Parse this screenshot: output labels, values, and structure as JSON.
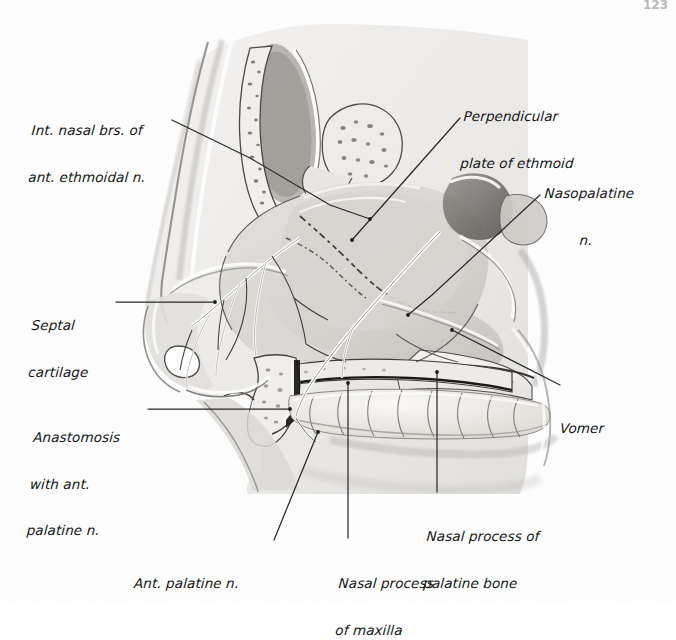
{
  "figure": {
    "page_number": "123",
    "style": "pencil-and-wash anatomical illustration, lateral view of nasal septum"
  },
  "labels": [
    {
      "id": "int-nasal-brs",
      "name": "int-nasal-branches-anterior-ethmoidal-nerve",
      "lines": [
        "Int. nasal brs. of",
        "ant. ethmoidal n."
      ],
      "text": "Int. nasal brs. of ant. ethmoidal n.",
      "x": 30,
      "y": 92,
      "align": "left",
      "leader": [
        [
          172,
          120
        ],
        [
          250,
          158
        ],
        [
          330,
          205
        ],
        [
          370,
          219
        ]
      ]
    },
    {
      "id": "perpendicular-plate",
      "name": "perpendicular-plate-of-ethmoid",
      "lines": [
        "Perpendicular",
        "plate of ethmoid"
      ],
      "text": "Perpendicular plate of ethmoid",
      "x": 462,
      "y": 78,
      "align": "left",
      "leader": [
        [
          460,
          118
        ],
        [
          352,
          240
        ]
      ]
    },
    {
      "id": "nasopalatine",
      "name": "nasopalatine-nerve",
      "lines": [
        "Nasopalatine",
        "n."
      ],
      "text": "Nasopalatine n.",
      "x": 543,
      "y": 155,
      "align": "left",
      "leader": [
        [
          540,
          195
        ],
        [
          432,
          295
        ],
        [
          408,
          315
        ]
      ]
    },
    {
      "id": "septal-cartilage",
      "name": "septal-cartilage",
      "lines": [
        "Septal",
        "cartilage"
      ],
      "text": "Septal cartilage",
      "x": 30,
      "y": 287,
      "align": "left",
      "leader": [
        [
          116,
          302
        ],
        [
          215,
          302
        ]
      ]
    },
    {
      "id": "vomer",
      "name": "vomer",
      "lines": [
        "Vomer"
      ],
      "text": "Vomer",
      "x": 560,
      "y": 390,
      "align": "left",
      "leader": [
        [
          560,
          385
        ],
        [
          452,
          330
        ]
      ]
    },
    {
      "id": "anastomosis",
      "name": "anastomosis-with-anterior-palatine-nerve",
      "lines": [
        "Anastomosis",
        "with ant.",
        "palatine n."
      ],
      "text": "Anastomosis with ant. palatine n.",
      "x": 30,
      "y": 399,
      "align": "left",
      "leader": [
        [
          148,
          409
        ],
        [
          290,
          409
        ]
      ]
    },
    {
      "id": "nasal-process-palatine",
      "name": "nasal-process-of-palatine-bone",
      "lines": [
        "Nasal process of",
        "palatine bone"
      ],
      "text": "Nasal process of palatine bone",
      "x": 425,
      "y": 498,
      "align": "left",
      "leader": [
        [
          437,
          492
        ],
        [
          437,
          372
        ]
      ]
    },
    {
      "id": "ant-palatine",
      "name": "anterior-palatine-nerve",
      "lines": [
        "Ant. palatine n."
      ],
      "text": "Ant. palatine n.",
      "x": 134,
      "y": 545,
      "align": "left",
      "leader": [
        [
          274,
          540
        ],
        [
          318,
          432
        ]
      ]
    },
    {
      "id": "nasal-process-maxilla",
      "name": "nasal-process-of-maxilla",
      "lines": [
        "Nasal process",
        "of maxilla"
      ],
      "text": "Nasal process of maxilla",
      "x": 337,
      "y": 545,
      "align": "left",
      "leader": [
        [
          348,
          538
        ],
        [
          348,
          383
        ]
      ]
    }
  ],
  "anatomy": {
    "structures": [
      "frontal sinus",
      "cribriform plate region",
      "perpendicular plate of ethmoid",
      "septal cartilage",
      "vomer",
      "nasal process of maxilla",
      "nasal process of palatine bone",
      "hard palate",
      "upper teeth",
      "sphenoid sinus",
      "nasopalatine nerve",
      "internal nasal branches of anterior ethmoidal nerve",
      "anterior palatine nerve",
      "incisive canal"
    ]
  },
  "colors": {
    "ink": "#141414",
    "leader": "#2a2a2a",
    "paper": "#fefefe",
    "wash_light": "#e4e3e1",
    "wash_mid": "#cfcdca",
    "wash_dark": "#b4b1ad",
    "bone": "#f1efec",
    "nerve": "#ffffff",
    "outline": "#3b3a38"
  }
}
